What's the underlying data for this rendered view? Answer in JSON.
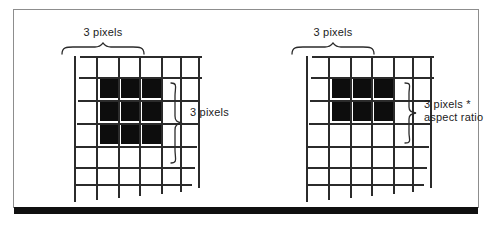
{
  "figure": {
    "type": "diagram",
    "frame_color": "#8d8d8d",
    "rule_color": "#101010",
    "grid_line_color": "#2b2b2b",
    "filled_cell_color": "#0d0d0d",
    "background": "#ffffff"
  },
  "panels": [
    {
      "id": "left",
      "name": "square-pixel-panel",
      "top_label": "3 pixels",
      "side_label": "3 pixels",
      "grid": {
        "columns": 6,
        "rows": 6
      },
      "filled_block": {
        "start_col": 1,
        "start_row": 1,
        "cols": 3,
        "rows": 3
      }
    },
    {
      "id": "right",
      "name": "aspect-ratio-pixel-panel",
      "top_label": "3 pixels",
      "side_label": "3 pixels *\naspect ratio",
      "side_label_line1": "3 pixels *",
      "side_label_line2": "aspect ratio",
      "grid": {
        "columns": 6,
        "rows": 6
      },
      "filled_block": {
        "start_col": 1,
        "start_row": 1,
        "cols": 3,
        "rows": 2
      }
    }
  ]
}
